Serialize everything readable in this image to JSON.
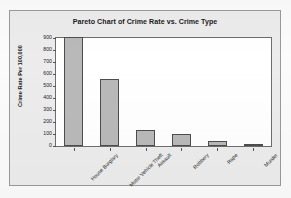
{
  "chart_data": {
    "type": "bar",
    "title": "Pareto Chart of Crime Rate vs. Crime Type",
    "xlabel": "",
    "ylabel": "Crime Rate Per 100,000",
    "categories": [
      "House Burglary",
      "Motor Vehicle Theft",
      "Assault",
      "Robbery",
      "Rape",
      "Murder"
    ],
    "values": [
      910,
      555,
      130,
      100,
      40,
      7
    ],
    "ylim": [
      0,
      900
    ],
    "ytick_labels": [
      "900",
      "800",
      "700",
      "600",
      "500",
      "400",
      "300",
      "200",
      "100",
      "0"
    ],
    "ytick_values": [
      900,
      800,
      700,
      600,
      500,
      400,
      300,
      200,
      100,
      0
    ],
    "grid": false,
    "legend": false,
    "bar_color": "#b9b9b9",
    "bar_border_color": "#4d4d4d",
    "plot_background": "#ffffff",
    "frame_background": "#ececed",
    "text_color": "#1b1b1b"
  }
}
